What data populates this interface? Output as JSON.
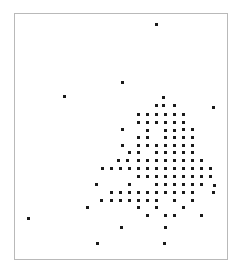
{
  "figure": {
    "width": 243,
    "height": 273,
    "background_color": "#ffffff"
  },
  "frame": {
    "x": 14,
    "y": 13,
    "width": 214,
    "height": 247,
    "border_color": "#b9b9b9",
    "border_width": 1
  },
  "chart_data": {
    "type": "scatter",
    "title": "",
    "subtitle": "",
    "xlabel": "",
    "ylabel": "",
    "xlim": [
      14,
      228
    ],
    "ylim": [
      13,
      260
    ],
    "grid": false,
    "legend": null,
    "axis_ticks": {
      "x": [],
      "y": []
    },
    "annotations": [],
    "marker": {
      "shape": "square",
      "size_px": 3,
      "color": "#1a1a1a"
    },
    "lattice": {
      "description": "points fall on a regular lattice",
      "x_spacing": 9,
      "y_spacing": 8
    },
    "point_count": 149,
    "points": [
      [
        156,
        24
      ],
      [
        122,
        82
      ],
      [
        64,
        96
      ],
      [
        163,
        97
      ],
      [
        163,
        105
      ],
      [
        213,
        107
      ],
      [
        138,
        114
      ],
      [
        147,
        114
      ],
      [
        156,
        114
      ],
      [
        174,
        114
      ],
      [
        183,
        114
      ],
      [
        147,
        122
      ],
      [
        165,
        122
      ],
      [
        174,
        122
      ],
      [
        183,
        122
      ],
      [
        122,
        129
      ],
      [
        147,
        130
      ],
      [
        165,
        130
      ],
      [
        174,
        130
      ],
      [
        138,
        137
      ],
      [
        147,
        137
      ],
      [
        165,
        137
      ],
      [
        174,
        137
      ],
      [
        183,
        137
      ],
      [
        192,
        137
      ],
      [
        122,
        145
      ],
      [
        138,
        145
      ],
      [
        156,
        145
      ],
      [
        165,
        145
      ],
      [
        174,
        145
      ],
      [
        183,
        145
      ],
      [
        192,
        145
      ],
      [
        138,
        152
      ],
      [
        156,
        152
      ],
      [
        165,
        152
      ],
      [
        174,
        152
      ],
      [
        183,
        152
      ],
      [
        192,
        152
      ],
      [
        118,
        160
      ],
      [
        127,
        160
      ],
      [
        138,
        160
      ],
      [
        147,
        160
      ],
      [
        156,
        160
      ],
      [
        165,
        160
      ],
      [
        174,
        160
      ],
      [
        183,
        160
      ],
      [
        192,
        160
      ],
      [
        201,
        160
      ],
      [
        102,
        168
      ],
      [
        111,
        168
      ],
      [
        138,
        168
      ],
      [
        147,
        168
      ],
      [
        156,
        168
      ],
      [
        165,
        168
      ],
      [
        174,
        168
      ],
      [
        183,
        168
      ],
      [
        192,
        168
      ],
      [
        201,
        168
      ],
      [
        210,
        168
      ],
      [
        147,
        176
      ],
      [
        156,
        176
      ],
      [
        165,
        176
      ],
      [
        174,
        176
      ],
      [
        183,
        176
      ],
      [
        192,
        176
      ],
      [
        201,
        176
      ],
      [
        210,
        176
      ],
      [
        96,
        184
      ],
      [
        129,
        184
      ],
      [
        156,
        184
      ],
      [
        165,
        184
      ],
      [
        174,
        184
      ],
      [
        183,
        184
      ],
      [
        192,
        184
      ],
      [
        201,
        184
      ],
      [
        214,
        185
      ],
      [
        111,
        192
      ],
      [
        129,
        192
      ],
      [
        147,
        192
      ],
      [
        156,
        192
      ],
      [
        165,
        192
      ],
      [
        174,
        192
      ],
      [
        183,
        192
      ],
      [
        192,
        192
      ],
      [
        213,
        192
      ],
      [
        101,
        200
      ],
      [
        111,
        200
      ],
      [
        120,
        200
      ],
      [
        129,
        200
      ],
      [
        138,
        200
      ],
      [
        147,
        200
      ],
      [
        156,
        200
      ],
      [
        174,
        200
      ],
      [
        192,
        200
      ],
      [
        87,
        207
      ],
      [
        138,
        207
      ],
      [
        183,
        207
      ],
      [
        147,
        215
      ],
      [
        165,
        215
      ],
      [
        201,
        215
      ],
      [
        28,
        218
      ],
      [
        121,
        227
      ],
      [
        165,
        227
      ],
      [
        97,
        243
      ],
      [
        164,
        243
      ],
      [
        138,
        114
      ],
      [
        156,
        105
      ],
      [
        165,
        114
      ],
      [
        183,
        129
      ],
      [
        192,
        129
      ],
      [
        156,
        122
      ],
      [
        138,
        122
      ],
      [
        174,
        105
      ],
      [
        183,
        114
      ],
      [
        147,
        145
      ],
      [
        129,
        152
      ],
      [
        120,
        168
      ],
      [
        129,
        168
      ],
      [
        138,
        176
      ],
      [
        138,
        192
      ],
      [
        120,
        192
      ],
      [
        165,
        192
      ],
      [
        156,
        207
      ],
      [
        174,
        215
      ]
    ]
  }
}
